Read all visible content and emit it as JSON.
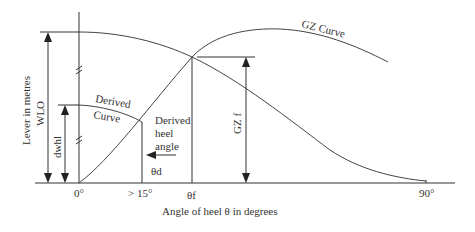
{
  "diagram": {
    "type": "stability-curve",
    "title": "",
    "x_axis": {
      "label": "Angle of heel θ in degrees",
      "ticks": [
        "0°",
        "> 15°",
        "θf",
        "90°"
      ]
    },
    "y_axis": {
      "label": "Lever in metres"
    },
    "curves": {
      "gz": "GZ Curve",
      "derived_line1": "Derived",
      "derived_line2": "Curve"
    },
    "dimensions": {
      "wlo": "WLO",
      "dwhl": "dwhl",
      "gzf": "GZ f"
    },
    "annotations": {
      "derived_heel_line1": "Derived",
      "derived_heel_line2": "heel",
      "derived_heel_line3": "angle",
      "theta_d": "θd"
    },
    "colors": {
      "line": "#333333",
      "background": "#ffffff"
    }
  }
}
